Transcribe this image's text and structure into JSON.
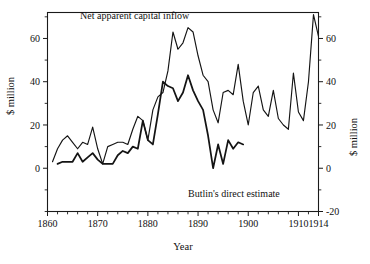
{
  "chart_data": {
    "type": "line",
    "title": "",
    "xlabel": "Year",
    "ylabel": "$ million",
    "ylabel_right": "$ million",
    "grid": false,
    "legend_position": "inline-annotation",
    "xlim": [
      1860,
      1914
    ],
    "xticks": [
      1860,
      1870,
      1880,
      1890,
      1900,
      1910,
      1914
    ],
    "xticklabels": [
      "1860",
      "1870",
      "1880",
      "1890",
      "1900",
      "1910",
      "1914"
    ],
    "xminor_step": 2,
    "ylim_left": [
      -20,
      72
    ],
    "yticks_left": [
      0,
      20,
      40,
      60
    ],
    "yticklabels_left": [
      "0",
      "20",
      "40",
      "60"
    ],
    "yminor_step_left": 10,
    "ylim_right": [
      -20,
      72
    ],
    "yticks_right": [
      -20,
      0,
      20,
      40,
      60
    ],
    "yticklabels_right": [
      "-20",
      "0",
      "20",
      "40",
      "60"
    ],
    "yminor_step_right": 10,
    "annotations": [
      {
        "text": "Net apparent capital inflow",
        "x": 1866.5,
        "y": 69,
        "anchor": "start"
      },
      {
        "text": "Butlin's direct estimate",
        "x": 1888.0,
        "y": -13.5,
        "anchor": "start"
      }
    ],
    "series": [
      {
        "name": "Net apparent capital inflow",
        "axis": "left",
        "linewidth": "thin",
        "x": [
          1861,
          1862,
          1863,
          1864,
          1865,
          1866,
          1867,
          1868,
          1869,
          1870,
          1871,
          1872,
          1873,
          1874,
          1875,
          1876,
          1877,
          1878,
          1879,
          1880,
          1881,
          1882,
          1883,
          1884,
          1885,
          1886,
          1887,
          1888,
          1889,
          1890,
          1891,
          1892,
          1893,
          1894,
          1895,
          1896,
          1897,
          1898,
          1899,
          1900,
          1901,
          1902,
          1903,
          1904,
          1905,
          1906,
          1907,
          1908,
          1909,
          1910,
          1911,
          1912,
          1913,
          1914
        ],
        "values": [
          3,
          9,
          13,
          15,
          12,
          9,
          12,
          11,
          19,
          9,
          2,
          10,
          11,
          12,
          12,
          11,
          18,
          24,
          22,
          13,
          27,
          33,
          35,
          45,
          63,
          55,
          58,
          65,
          63,
          52,
          43,
          40,
          27,
          21,
          35,
          36,
          34,
          48,
          31,
          20,
          35,
          38,
          27,
          24,
          36,
          23,
          20,
          18,
          44,
          26,
          22,
          40,
          71,
          61
        ]
      },
      {
        "name": "Butlin's direct estimate",
        "axis": "right",
        "linewidth": "thick",
        "x": [
          1862,
          1863,
          1864,
          1865,
          1866,
          1867,
          1868,
          1869,
          1870,
          1871,
          1872,
          1873,
          1874,
          1875,
          1876,
          1877,
          1878,
          1879,
          1880,
          1881,
          1882,
          1883,
          1884,
          1885,
          1886,
          1887,
          1888,
          1889,
          1890,
          1891,
          1892,
          1893,
          1894,
          1895,
          1896,
          1897,
          1898,
          1899
        ],
        "values": [
          2,
          3,
          3,
          3,
          7,
          3,
          5,
          7,
          4,
          2,
          2,
          2,
          6,
          8,
          7,
          10,
          9,
          22,
          13,
          11,
          25,
          40,
          38,
          37,
          31,
          35,
          43,
          36,
          31,
          27,
          15,
          0,
          11,
          2,
          13,
          9,
          12,
          11
        ]
      }
    ]
  },
  "axes": {
    "left_title": "$ million",
    "right_title": "$ million",
    "x_title": "Year"
  }
}
